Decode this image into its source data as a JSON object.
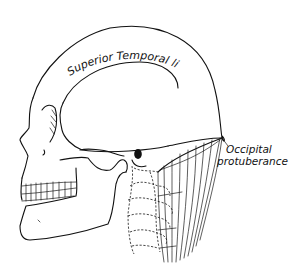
{
  "figure": {
    "labels": {
      "superior_temporal_line": "Superior Temporal line",
      "occipital_line1": "Occipital",
      "occipital_line2": "protuberance"
    },
    "colors": {
      "ink": "#111111",
      "background": "#ffffff"
    }
  }
}
